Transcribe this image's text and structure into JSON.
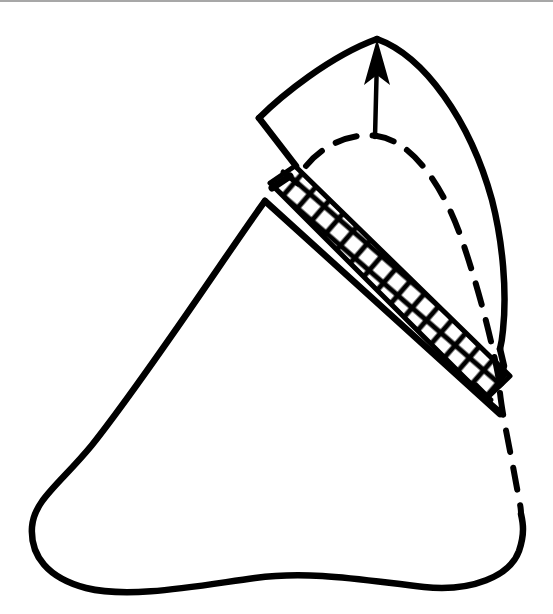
{
  "figure": {
    "kind": "line-drawing",
    "background_color": "#ffffff",
    "ink_color": "#000000",
    "border_color": "#8a8a8a"
  },
  "canvas": {
    "width": 553,
    "height": 614
  },
  "elements": {
    "top_border_rule": {
      "name": "top border rule",
      "color": "#8a8a8a"
    },
    "main_body": {
      "name": "main body outline",
      "style": "solid",
      "stroke_width": 6,
      "apex_point": [
        265,
        201
      ],
      "bottom_left_corner": [
        32,
        527
      ],
      "bottom_right_corner": [
        521,
        514
      ]
    },
    "upper_flap": {
      "name": "upper displaced flap outline",
      "style": "solid",
      "stroke_width": 6,
      "left_corner": [
        259,
        118
      ],
      "top_apex": [
        377,
        38
      ],
      "lower_tip": [
        501,
        347
      ]
    },
    "hatched_band": {
      "name": "cross-hatched cut interface band",
      "pattern": "cross-hatch",
      "stroke_width": 4,
      "upper_left_end": [
        273,
        187
      ],
      "lower_right_end": [
        500,
        389
      ],
      "band_thickness": 36
    },
    "dashed_curve": {
      "name": "dashed original-position curve",
      "style": "dashed",
      "stroke_width": 6,
      "dash_pattern": "22 16"
    },
    "direction_arrow": {
      "name": "displacement direction arrow",
      "style": "solid with filled head",
      "stroke_width": 4,
      "tail_point": [
        375,
        137
      ],
      "head_point": [
        377,
        41
      ],
      "direction": "up"
    }
  }
}
